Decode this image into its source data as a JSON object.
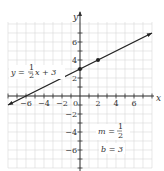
{
  "chart_data": {
    "type": "line",
    "title": "",
    "xlabel": "x",
    "ylabel": "y",
    "xlim": [
      -8,
      8
    ],
    "ylim": [
      -8,
      8
    ],
    "grid": true,
    "x_ticks": [
      -6,
      -4,
      -2,
      2,
      4,
      6
    ],
    "y_ticks": [
      6,
      4,
      2,
      -2,
      -4,
      -6
    ],
    "origin_label": "0",
    "series": [
      {
        "name": "y = 1/2 x + 3",
        "equation": "y = ½x + 3",
        "slope": 0.5,
        "intercept": 3,
        "x": [
          -8,
          8
        ],
        "y": [
          -1,
          7
        ]
      }
    ],
    "points": [
      {
        "x": 0,
        "y": 3
      },
      {
        "x": 2,
        "y": 4
      }
    ],
    "annotations": {
      "equation_label": {
        "left": "y =",
        "num": "1",
        "den": "2",
        "right": "x + 3"
      },
      "slope_label": {
        "left": "m =",
        "num": "1",
        "den": "2"
      },
      "intercept_label": "b = 3"
    },
    "colors": {
      "line": "#222222",
      "grid": "#d8d8d8",
      "axis": "#333333"
    }
  }
}
